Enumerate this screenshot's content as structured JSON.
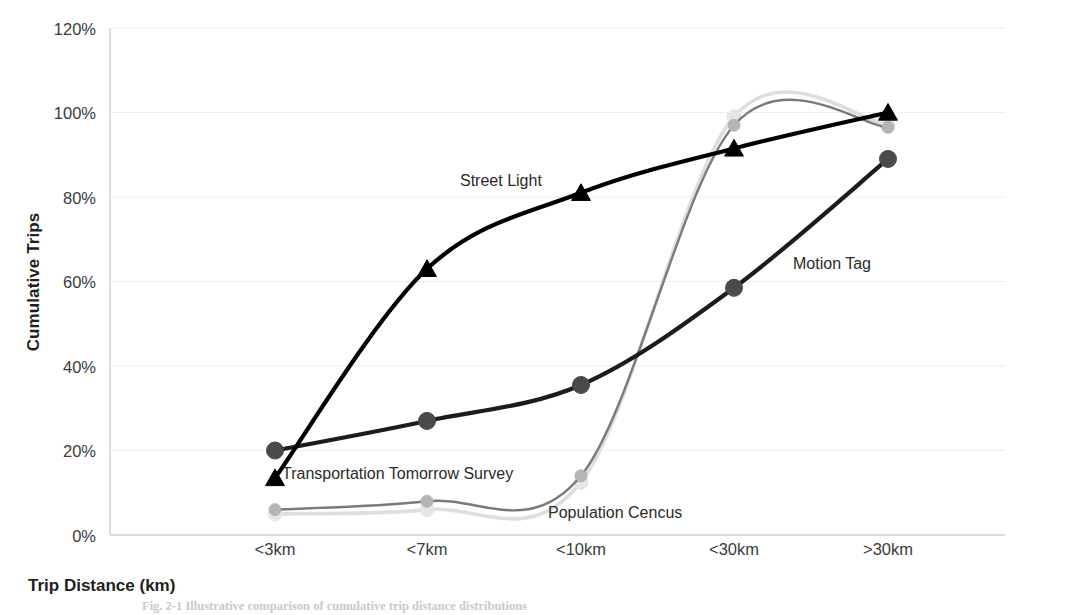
{
  "chart_data": {
    "type": "line",
    "title": "",
    "xlabel": "Trip Distance (km)",
    "ylabel": "Cumulative Trips",
    "categories": [
      "<3km",
      "<7km",
      "<10km",
      "<30km",
      ">30km"
    ],
    "ytick_labels": [
      "0%",
      "20%",
      "40%",
      "60%",
      "80%",
      "100%",
      "120%"
    ],
    "ytick_values": [
      0,
      20,
      40,
      60,
      80,
      100,
      120
    ],
    "ylim": [
      0,
      120
    ],
    "grid": true,
    "legend": "inline-annotations",
    "series": [
      {
        "name": "Street Light",
        "values": [
          13.5,
          63,
          81,
          91.5,
          100
        ],
        "color": "#000000",
        "marker": "triangle",
        "label_x": 460,
        "label_y": 172
      },
      {
        "name": "Motion Tag",
        "values": [
          20,
          27,
          35.5,
          58.5,
          89
        ],
        "color": "#1a1a1a",
        "marker": "circle",
        "label_x": 793,
        "label_y": 255
      },
      {
        "name": "Transportation Tomorrow Survey",
        "values": [
          6,
          8,
          14,
          97,
          96.5
        ],
        "color": "#6e6e6e",
        "marker": "circle",
        "label_x": 282,
        "label_y": 465
      },
      {
        "name": "Population Cencus",
        "values": [
          5,
          6,
          12.5,
          99,
          97
        ],
        "color": "#dcdcdc",
        "marker": "circle",
        "label_x": 548,
        "label_y": 504
      }
    ]
  },
  "axis": {
    "y_title": "Cumulative Trips",
    "x_title": "Trip Distance (km)",
    "y_ticks": [
      {
        "label": "120%",
        "top": 20
      },
      {
        "label": "100%",
        "top": 104
      },
      {
        "label": "80%",
        "top": 189
      },
      {
        "label": "60%",
        "top": 273
      },
      {
        "label": "40%",
        "top": 358
      },
      {
        "label": "20%",
        "top": 442
      },
      {
        "label": "0%",
        "top": 527
      }
    ],
    "x_ticks": [
      {
        "label": "<3km",
        "left": 220
      },
      {
        "label": "<7km",
        "left": 372
      },
      {
        "label": "<10km",
        "left": 526
      },
      {
        "label": "<30km",
        "left": 679
      },
      {
        "label": ">30km",
        "left": 833
      }
    ]
  },
  "caption": {
    "text": "Fig. 2-1  Illustrative comparison of cumulative trip distance distributions"
  },
  "colors": {
    "axis_line": "#cfcfcf",
    "grid": "#ededed",
    "street_light": "#000000",
    "motion_tag": "#3a3a3a",
    "tts": "#757575",
    "census": "#dddddd",
    "text": "#231f20"
  }
}
